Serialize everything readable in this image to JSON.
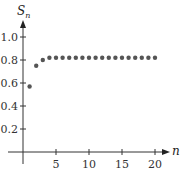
{
  "chart_data": {
    "type": "scatter",
    "title": "",
    "xlabel": "n",
    "ylabel": "S_n",
    "ylabel_main": "S",
    "ylabel_sub": "n",
    "xlim": [
      0,
      22
    ],
    "ylim": [
      0,
      1.1
    ],
    "grid": false,
    "legend": null,
    "x_ticks": [
      5,
      10,
      15,
      20
    ],
    "x_tick_labels": [
      "5",
      "10",
      "15",
      "20"
    ],
    "y_ticks": [
      0.2,
      0.4,
      0.6,
      0.8,
      1.0
    ],
    "y_tick_labels": [
      "0.2",
      "0.4",
      "0.6",
      "0.8",
      "1.0"
    ],
    "series": [
      {
        "name": "S_n",
        "color": "#555555",
        "x": [
          1,
          2,
          3,
          4,
          5,
          6,
          7,
          8,
          9,
          10,
          11,
          12,
          13,
          14,
          15,
          16,
          17,
          18,
          19,
          20
        ],
        "y": [
          0.57,
          0.75,
          0.8,
          0.82,
          0.82,
          0.82,
          0.82,
          0.82,
          0.82,
          0.82,
          0.82,
          0.82,
          0.82,
          0.82,
          0.82,
          0.82,
          0.82,
          0.82,
          0.82,
          0.82
        ]
      }
    ]
  }
}
